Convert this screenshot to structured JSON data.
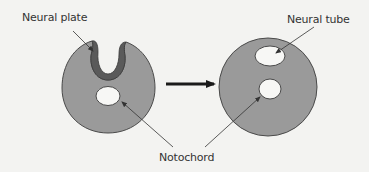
{
  "diagram": {
    "type": "biology-schematic",
    "stages": [
      {
        "name": "before",
        "structures": [
          "Neural plate",
          "Notochord"
        ]
      },
      {
        "name": "after",
        "structures": [
          "Neural tube",
          "Notochord"
        ]
      }
    ],
    "transition": "arrow-right"
  },
  "labels": {
    "neural_plate": "Neural plate",
    "neural_tube": "Neural tube",
    "notochord": "Notochord"
  },
  "colors": {
    "background": "#f3f3f1",
    "tissue_fill": "#9a9a9a",
    "neural_plate_fill": "#5a5a5a",
    "outline": "#4a4a4a",
    "cavity_fill": "#f7f7f5",
    "arrow": "#1a1a1a",
    "text": "#333333"
  }
}
